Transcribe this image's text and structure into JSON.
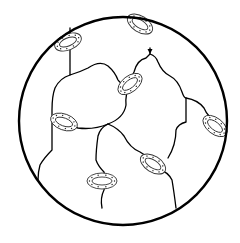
{
  "diagram": {
    "title": "",
    "colors": {
      "stroke": "#000000",
      "background": "#ffffff",
      "ring": "#333333"
    },
    "boundary": {
      "shape": "circle",
      "cx": 123,
      "cy": 121,
      "r": 104
    },
    "chains": [
      "M70 28 L70 75 Q80 72 88 68 Q100 60 108 66 Q115 72 118 80 Q122 86 128 82",
      "M150 48 L150 54 Q148 56 146 58 Q137 60 134 72 Q132 76 130 82",
      "M70 75 Q60 78 55 88 Q52 96 52 110 L52 150 Q44 158 40 165 Q38 172 38 180",
      "M130 82 Q125 95 126 105 Q124 118 108 124 Q94 130 78 128 Q70 126 66 124",
      "M150 54 Q156 56 158 62 Q162 72 170 76 Q178 80 182 92 Q184 98 186 98 Q198 100 204 108 Q208 118 218 122",
      "M186 98 L186 122 Q178 124 176 130 Q176 145 168 158",
      "M108 124 Q118 128 124 136 Q130 148 140 152 Q146 156 150 158",
      "M108 124 Q100 128 98 136 Q96 150 96 160 Q98 166 104 172 Q106 180 104 190 Q100 198 102 208",
      "M160 170 Q168 172 172 180 Q174 192 176 208"
    ],
    "rings": [
      {
        "cx": 68,
        "cy": 42,
        "rx": 14,
        "ry": 8,
        "rotate": -22
      },
      {
        "cx": 140,
        "cy": 24,
        "rx": 14,
        "ry": 8,
        "rotate": 32
      },
      {
        "cx": 130,
        "cy": 84,
        "rx": 14,
        "ry": 8,
        "rotate": -38
      },
      {
        "cx": 64,
        "cy": 122,
        "rx": 14,
        "ry": 8,
        "rotate": 20
      },
      {
        "cx": 215,
        "cy": 126,
        "rx": 14,
        "ry": 8,
        "rotate": 38
      },
      {
        "cx": 153,
        "cy": 164,
        "rx": 14,
        "ry": 8,
        "rotate": 32
      },
      {
        "cx": 102,
        "cy": 181,
        "rx": 15,
        "ry": 8,
        "rotate": 0
      }
    ],
    "crosslink_points": [
      {
        "x": 70,
        "y": 75
      },
      {
        "x": 130,
        "y": 82
      },
      {
        "x": 108,
        "y": 124
      },
      {
        "x": 186,
        "y": 98
      }
    ],
    "arrow": {
      "x": 150,
      "y": 52
    }
  }
}
